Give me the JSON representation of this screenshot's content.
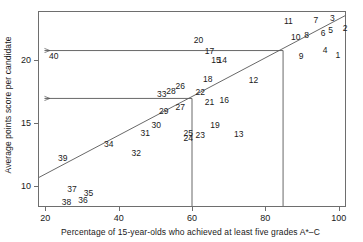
{
  "chart_data": {
    "type": "scatter",
    "title": "",
    "xlabel": "Percentage of 15-year-olds who achieved at least five grades A*–C",
    "ylabel": "Average points score per candidate",
    "xlim": [
      18,
      102
    ],
    "ylim": [
      8.3,
      23.9
    ],
    "grid": false,
    "legend": "none",
    "xticks": [
      20,
      40,
      60,
      80,
      100
    ],
    "yticks": [
      10,
      15,
      20
    ],
    "point_label_note": "Each data point is rendered as its numeric rank label (1–40) instead of a marker symbol.",
    "points": [
      {
        "label": "1",
        "x": 99.5,
        "y": 20.5
      },
      {
        "label": "2",
        "x": 101.5,
        "y": 22.6
      },
      {
        "label": "3",
        "x": 98.0,
        "y": 23.4
      },
      {
        "label": "4",
        "x": 96.0,
        "y": 20.9
      },
      {
        "label": "5",
        "x": 97.5,
        "y": 22.5
      },
      {
        "label": "6",
        "x": 95.5,
        "y": 22.2
      },
      {
        "label": "7",
        "x": 93.5,
        "y": 23.3
      },
      {
        "label": "8",
        "x": 91.0,
        "y": 22.1
      },
      {
        "label": "9",
        "x": 89.5,
        "y": 20.4
      },
      {
        "label": "10",
        "x": 88.0,
        "y": 21.9
      },
      {
        "label": "11",
        "x": 86.0,
        "y": 23.2
      },
      {
        "label": "12",
        "x": 76.5,
        "y": 18.5
      },
      {
        "label": "13",
        "x": 72.5,
        "y": 14.2
      },
      {
        "label": "14",
        "x": 68.0,
        "y": 20.1
      },
      {
        "label": "15",
        "x": 66.3,
        "y": 20.1
      },
      {
        "label": "16",
        "x": 68.5,
        "y": 16.9
      },
      {
        "label": "17",
        "x": 64.5,
        "y": 20.8
      },
      {
        "label": "18",
        "x": 64.0,
        "y": 18.6
      },
      {
        "label": "19",
        "x": 66.0,
        "y": 14.9
      },
      {
        "label": "20",
        "x": 61.5,
        "y": 21.7
      },
      {
        "label": "21",
        "x": 64.5,
        "y": 16.7
      },
      {
        "label": "22",
        "x": 62.0,
        "y": 17.5
      },
      {
        "label": "23",
        "x": 62.0,
        "y": 14.1
      },
      {
        "label": "24",
        "x": 58.7,
        "y": 13.9
      },
      {
        "label": "25",
        "x": 58.7,
        "y": 14.3
      },
      {
        "label": "26",
        "x": 56.5,
        "y": 18.0
      },
      {
        "label": "27",
        "x": 56.5,
        "y": 16.3
      },
      {
        "label": "28",
        "x": 54.0,
        "y": 17.6
      },
      {
        "label": "29",
        "x": 52.0,
        "y": 16.0
      },
      {
        "label": "30",
        "x": 50.0,
        "y": 14.9
      },
      {
        "label": "31",
        "x": 47.0,
        "y": 14.3
      },
      {
        "label": "32",
        "x": 44.5,
        "y": 12.7
      },
      {
        "label": "33",
        "x": 51.5,
        "y": 17.4
      },
      {
        "label": "34",
        "x": 37.0,
        "y": 13.4
      },
      {
        "label": "35",
        "x": 31.5,
        "y": 9.5
      },
      {
        "label": "36",
        "x": 30.0,
        "y": 8.9
      },
      {
        "label": "37",
        "x": 27.0,
        "y": 9.8
      },
      {
        "label": "38",
        "x": 25.5,
        "y": 8.8
      },
      {
        "label": "39",
        "x": 24.5,
        "y": 12.3
      },
      {
        "label": "40",
        "x": 22.0,
        "y": 20.4
      }
    ],
    "regression_line": {
      "x_start": 18,
      "y_start": 10.6,
      "x_end": 102,
      "y_end": 23.6
    },
    "reference_lines": [
      {
        "orientation": "vertical",
        "x": 60,
        "from_y": 8.3,
        "to_y": 16.95
      },
      {
        "orientation": "vertical",
        "x": 85,
        "from_y": 8.3,
        "to_y": 20.8
      }
    ],
    "annotation_arrows": [
      {
        "from_x": 85,
        "from_y": 20.8,
        "to_x": 19.5,
        "to_y": 20.8,
        "label": "40"
      },
      {
        "from_x": 60,
        "from_y": 16.95,
        "to_x": 19.5,
        "to_y": 16.95,
        "label": "33"
      }
    ],
    "colors": {
      "axis": "#6e6e6e",
      "line": "#555555",
      "text": "#1a1a1a",
      "background": "#ffffff"
    }
  }
}
